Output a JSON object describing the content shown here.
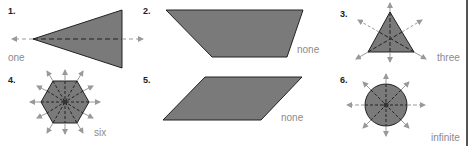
{
  "problems": [
    {
      "number": "1.",
      "shape": "isosceles-triangle",
      "answer": "one"
    },
    {
      "number": "2.",
      "shape": "trapezoid",
      "answer": "none"
    },
    {
      "number": "3.",
      "shape": "equilateral-triangle",
      "answer": "three"
    },
    {
      "number": "4.",
      "shape": "regular-hexagon",
      "answer": "six"
    },
    {
      "number": "5.",
      "shape": "parallelogram",
      "answer": "none"
    },
    {
      "number": "6.",
      "shape": "circle",
      "answer": "infinite"
    }
  ],
  "colors": {
    "shape_fill": "#7a7a7a",
    "shape_stroke": "#222222",
    "axis_line": "#333333",
    "arrow": "#999999",
    "answer_text": "#8a8a8a"
  }
}
